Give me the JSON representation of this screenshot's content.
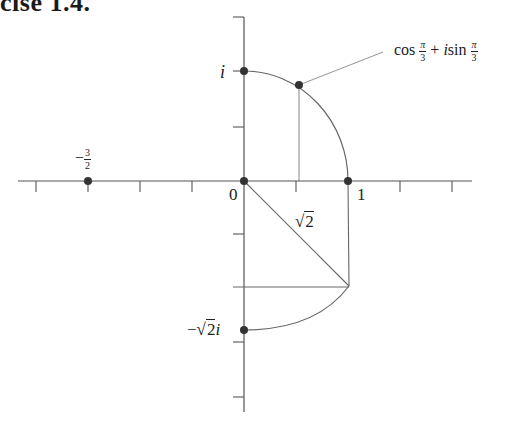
{
  "title": "cise 1.4.",
  "diagram": {
    "type": "complex-plane",
    "axes": {
      "origin_px": [
        244,
        181
      ],
      "unit_px_x": 104,
      "unit_px_y": 107,
      "x_range_px": [
        18,
        472
      ],
      "y_range_px": [
        17,
        412
      ],
      "x_ticks_px": [
        36,
        88,
        140,
        192,
        296,
        348,
        400,
        452
      ],
      "y_ticks_px": [
        17,
        71,
        127,
        234,
        287,
        342,
        397
      ]
    },
    "points": [
      {
        "name": "neg-three-halves",
        "label_num": "3",
        "label_den": "2",
        "label_sign": "−",
        "value": "-3/2",
        "px": [
          88,
          181
        ]
      },
      {
        "name": "origin",
        "label": "0",
        "value": "0",
        "px": [
          244,
          181
        ]
      },
      {
        "name": "one",
        "label": "1",
        "value": "1",
        "px": [
          348,
          181
        ]
      },
      {
        "name": "i",
        "label": "i",
        "value": "i",
        "px": [
          244,
          71
        ]
      },
      {
        "name": "cis-pi-3",
        "label_cos": "cos",
        "label_pi": "π",
        "label_three": "3",
        "label_plus": "+",
        "label_i": "i",
        "label_sin": "sin",
        "value": "cos(π/3) + i sin(π/3)",
        "px": [
          299,
          85
        ]
      },
      {
        "name": "neg-sqrt2-i",
        "label_minus": "−",
        "label_sqrt_arg": "2",
        "label_i": "i",
        "value": "-√2 i",
        "px": [
          244,
          330
        ]
      }
    ],
    "segment_labels": {
      "sqrt2_arg": "2"
    },
    "colors": {
      "axis": "#555555",
      "curve": "#666666",
      "point": "#333333",
      "text": "#222222"
    }
  }
}
